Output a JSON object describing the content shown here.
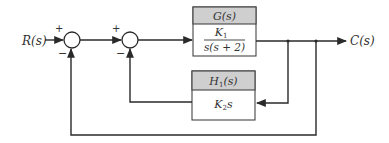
{
  "diagram": {
    "type": "block-diagram",
    "input_label": "R(s)",
    "output_label": "C(s)",
    "junctions": [
      {
        "id": "sum1",
        "plus": "+",
        "minus": "−"
      },
      {
        "id": "sum2",
        "plus": "+",
        "minus": "−"
      }
    ],
    "blocks": {
      "forward": {
        "header": "G(s)",
        "numerator": "K",
        "numerator_sub": "1",
        "denominator": "s(s + 2)"
      },
      "feedback": {
        "header_main": "H",
        "header_sub": "1",
        "header_tail": "(s)",
        "body_main": "K",
        "body_sub": "2",
        "body_tail": "s"
      }
    },
    "colors": {
      "header_fill": "#cfcfcf",
      "line": "#2a2a2a",
      "background": "#ffffff"
    }
  }
}
